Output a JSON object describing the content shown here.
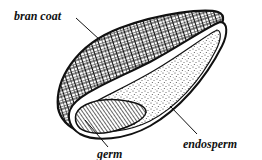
{
  "diagram": {
    "labels": {
      "bran_coat": "bran coat",
      "germ": "germ",
      "endosperm": "endosperm"
    },
    "colors": {
      "ink": "#111111",
      "background": "#ffffff"
    }
  }
}
